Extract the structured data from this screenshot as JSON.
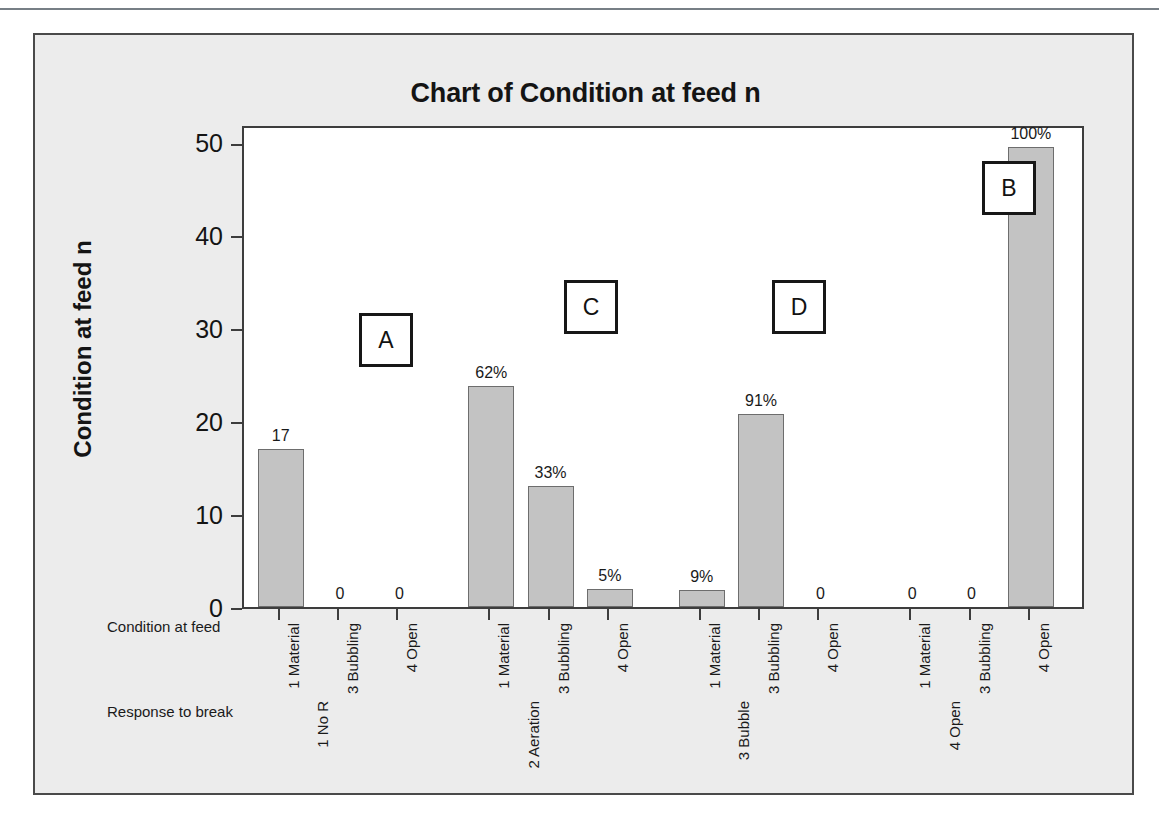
{
  "chart_data": {
    "type": "bar",
    "title": "Chart of Condition at feed n",
    "xlabel": "",
    "ylabel": "Condition at feed n",
    "ylim": [
      0,
      52
    ],
    "yticks": [
      0,
      10,
      20,
      30,
      40,
      50
    ],
    "grid": false,
    "legend": "none",
    "axis_row_titles": {
      "inner": "Condition at feed",
      "outer": "Response to break"
    },
    "groups": [
      {
        "group_label": "1 No R",
        "annotation": "A",
        "categories": [
          "1 Material",
          "3 Bubbling",
          "4 Open"
        ],
        "values": [
          17,
          0,
          0
        ],
        "data_labels": [
          "17",
          "0",
          "0"
        ]
      },
      {
        "group_label": "2 Aeration",
        "annotation": "C",
        "categories": [
          "1 Material",
          "3 Bubbling",
          "4 Open"
        ],
        "values": [
          23.8,
          13,
          1.9
        ],
        "data_labels": [
          "62%",
          "33%",
          "5%"
        ]
      },
      {
        "group_label": "3 Bubble",
        "annotation": "D",
        "categories": [
          "1 Material",
          "3 Bubbling",
          "4 Open"
        ],
        "values": [
          1.8,
          20.8,
          0
        ],
        "data_labels": [
          "9%",
          "91%",
          "0"
        ]
      },
      {
        "group_label": "4 Open",
        "annotation": "B",
        "categories": [
          "1 Material",
          "3 Bubbling",
          "4 Open"
        ],
        "values": [
          0,
          0,
          49.5
        ],
        "data_labels": [
          "0",
          "0",
          "100%"
        ]
      }
    ],
    "colors": {
      "bar_fill": "#c3c3c3",
      "bar_border": "#6d6d6d",
      "plot_background": "#ffffff",
      "chart_background": "#ececec",
      "frame_border": "#4a4a4a",
      "text": "#141414"
    }
  }
}
